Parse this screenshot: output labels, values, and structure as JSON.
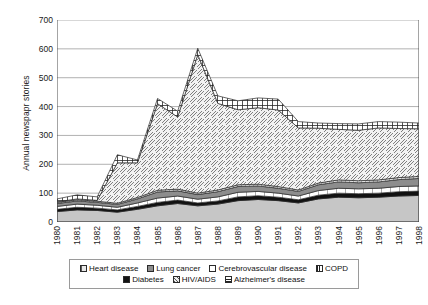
{
  "chart_data": {
    "type": "area",
    "stacked": true,
    "title": "",
    "xlabel": "",
    "ylabel": "Annual newspapr stories",
    "ylim": [
      0,
      700
    ],
    "ytick_step": 100,
    "yticks": [
      0,
      100,
      200,
      300,
      400,
      500,
      600,
      700
    ],
    "grid": true,
    "legend_position": "bottom",
    "categories": [
      "1980",
      "1981",
      "1982",
      "1983",
      "1984",
      "1985",
      "1986",
      "1987",
      "1988",
      "1989",
      "1990",
      "1991",
      "1992",
      "1993",
      "1994",
      "1995",
      "1996",
      "1997",
      "1998"
    ],
    "series": [
      {
        "name": "Heart disease",
        "swatch": "#c9c9c9",
        "pattern": "solid-light-gray",
        "values": [
          36,
          42,
          40,
          34,
          44,
          56,
          64,
          56,
          62,
          74,
          78,
          74,
          66,
          80,
          86,
          84,
          86,
          90,
          92
        ]
      },
      {
        "name": "Diabetes",
        "swatch": "#151515",
        "pattern": "solid-black",
        "values": [
          8,
          9,
          8,
          8,
          10,
          12,
          12,
          10,
          11,
          13,
          13,
          12,
          11,
          13,
          14,
          14,
          14,
          15,
          15
        ]
      },
      {
        "name": "Cerebrovascular disease",
        "swatch": "#ffffff",
        "pattern": "white-vertical-bars",
        "values": [
          10,
          11,
          10,
          9,
          12,
          15,
          14,
          13,
          14,
          16,
          15,
          14,
          13,
          16,
          17,
          17,
          17,
          18,
          18
        ]
      },
      {
        "name": "Lung cancer",
        "swatch": "#8e8e8e",
        "pattern": "solid-mid-gray",
        "values": [
          10,
          11,
          10,
          10,
          14,
          21,
          18,
          16,
          18,
          20,
          19,
          17,
          16,
          20,
          22,
          21,
          22,
          24,
          26
        ]
      },
      {
        "name": "COPD",
        "swatch": "#e3e3e3",
        "pattern": "vertical-hatch",
        "values": [
          4,
          4,
          4,
          4,
          5,
          6,
          6,
          5,
          6,
          6,
          6,
          6,
          5,
          6,
          7,
          7,
          7,
          7,
          7
        ]
      },
      {
        "name": "HIV/AIDS",
        "swatch": "#efefef",
        "pattern": "diagonal-hatch",
        "values": [
          2,
          3,
          3,
          140,
          120,
          300,
          250,
          480,
          300,
          260,
          265,
          265,
          215,
          190,
          175,
          175,
          180,
          170,
          165
        ]
      },
      {
        "name": "Alzheimer's disease",
        "swatch": "#ffffff",
        "pattern": "checker-grid",
        "values": [
          10,
          14,
          12,
          28,
          10,
          18,
          20,
          22,
          26,
          31,
          34,
          38,
          22,
          18,
          20,
          22,
          22,
          22,
          20
        ]
      }
    ],
    "totals": [
      80,
      94,
      87,
      233,
      215,
      428,
      384,
      602,
      437,
      420,
      430,
      426,
      348,
      343,
      341,
      340,
      348,
      346,
      343
    ]
  },
  "legend": {
    "rows": [
      [
        {
          "label": "Heart disease",
          "pattern": "vertical-hatch-light"
        },
        {
          "label": "Lung cancer",
          "pattern": "solid-mid-gray"
        },
        {
          "label": "Cerebrovascular disease",
          "pattern": "white-box"
        },
        {
          "label": "COPD",
          "pattern": "vertical-bars"
        }
      ],
      [
        {
          "label": "Diabetes",
          "pattern": "solid-black"
        },
        {
          "label": "HIV/AIDS",
          "pattern": "diagonal-hatch"
        },
        {
          "label": "Alzheimer's disease",
          "pattern": "checker-grid"
        }
      ]
    ]
  }
}
